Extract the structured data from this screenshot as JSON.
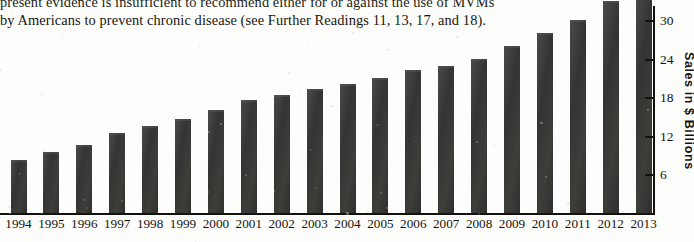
{
  "caption": {
    "line1": "present evidence is insufficient to recommend either for or against the use of MVMs",
    "line2": "by Americans to prevent chronic disease (see Further Readings 11, 13, 17, and 18)."
  },
  "chart_data": {
    "type": "bar",
    "title": "",
    "xlabel": "",
    "ylabel": "Sales in $ Billions",
    "categories": [
      "1994",
      "1995",
      "1996",
      "1997",
      "1998",
      "1999",
      "2000",
      "2001",
      "2002",
      "2003",
      "2004",
      "2005",
      "2006",
      "2007",
      "2008",
      "2009",
      "2010",
      "2011",
      "2012",
      "2013"
    ],
    "values": [
      8.2,
      9.5,
      10.6,
      12.4,
      13.6,
      14.6,
      16.0,
      17.5,
      18.3,
      19.2,
      20.0,
      21.0,
      22.3,
      22.9,
      23.9,
      26.0,
      28.0,
      30.0,
      33.0,
      35.0
    ],
    "ylim": [
      0,
      36
    ],
    "yticks": [
      6,
      12,
      18,
      24,
      30
    ],
    "ytick_labels": [
      "6",
      "12",
      "18",
      "24",
      "30"
    ],
    "grid": false,
    "legend": null,
    "bar_color": "#3a3a38",
    "axis_color": "#14120e",
    "note": "Bars for 2012 and 2013 extend above the cropped top edge of the image."
  }
}
